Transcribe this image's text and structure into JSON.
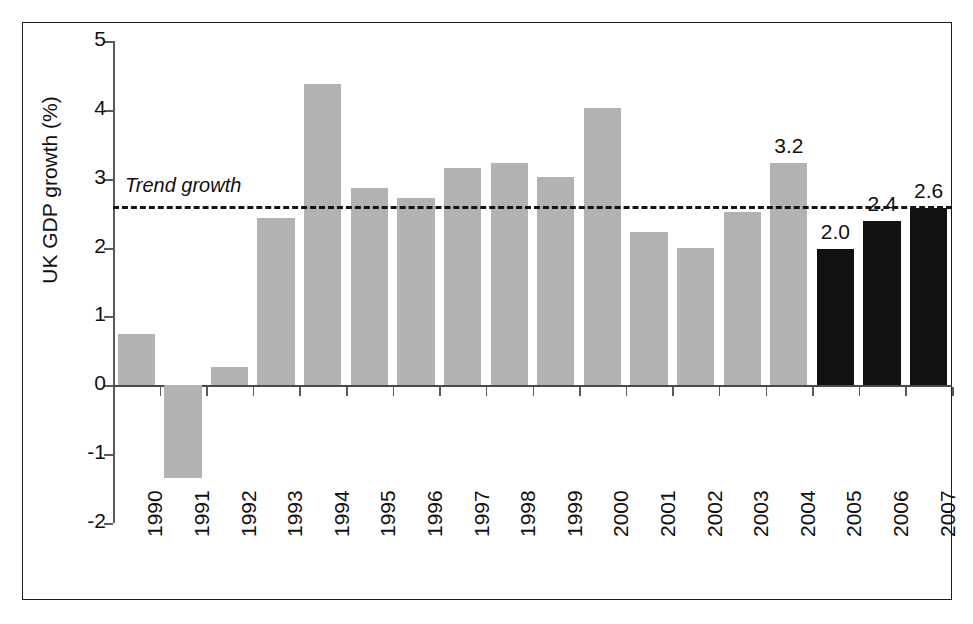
{
  "chart_data": {
    "type": "bar",
    "title": "",
    "subtitle": "",
    "xlabel": "",
    "ylabel": "UK GDP growth (%)",
    "ylim": [
      -2,
      5
    ],
    "ytick_labels": [
      "5",
      "4",
      "3",
      "2",
      "1",
      "0",
      "-1",
      "-2"
    ],
    "yticks": [
      5,
      4,
      3,
      2,
      1,
      0,
      -1,
      -2
    ],
    "grid": false,
    "legend": "none",
    "categories": [
      "1990",
      "1991",
      "1992",
      "1993",
      "1994",
      "1995",
      "1996",
      "1997",
      "1998",
      "1999",
      "2000",
      "2001",
      "2002",
      "2003",
      "2004",
      "2005",
      "2006",
      "2007"
    ],
    "values": [
      0.74,
      -1.35,
      0.27,
      2.43,
      4.38,
      2.86,
      2.72,
      3.16,
      3.23,
      3.03,
      4.03,
      2.22,
      2.0,
      2.52,
      3.23,
      1.98,
      2.38,
      2.58
    ],
    "bar_colors": [
      "grey",
      "grey",
      "grey",
      "grey",
      "grey",
      "grey",
      "grey",
      "grey",
      "grey",
      "grey",
      "grey",
      "grey",
      "grey",
      "grey",
      "grey",
      "black",
      "black",
      "black"
    ],
    "data_labels": [
      "",
      "",
      "",
      "",
      "",
      "",
      "",
      "",
      "",
      "",
      "",
      "",
      "",
      "",
      "3.2",
      "2.0",
      "2.4",
      "2.6"
    ],
    "annotations": [
      {
        "name": "trend-growth",
        "label": "Trend growth",
        "type": "hline",
        "value": 2.6,
        "style": "dashed",
        "italic": true
      }
    ],
    "colors": {
      "bar_grey": "#b2b2b2",
      "bar_black": "#111111",
      "axis": "#5a5a5a",
      "trend_line": "#141414",
      "text": "#111111",
      "background": "#ffffff",
      "frame": "#1a1a1a"
    }
  }
}
